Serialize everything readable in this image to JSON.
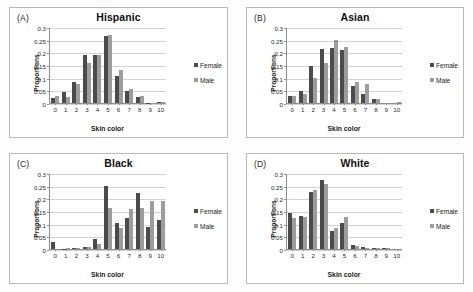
{
  "figure": {
    "y_ticks": [
      "0",
      "0.05",
      "0.1",
      "0.15",
      "0.2",
      "0.25",
      "0.3"
    ],
    "x_ticks": [
      "0",
      "1",
      "2",
      "3",
      "4",
      "5",
      "6",
      "7",
      "8",
      "9",
      "10"
    ],
    "ylabel": "Proportions",
    "xlabel": "Skin color",
    "legend": [
      {
        "label": "Female",
        "color": "#4b4b4b"
      },
      {
        "label": "Male",
        "color": "#9d9d9d"
      }
    ]
  },
  "panels": [
    {
      "tag": "(A)",
      "title": "Hispanic"
    },
    {
      "tag": "(B)",
      "title": "Asian"
    },
    {
      "tag": "(C)",
      "title": "Black"
    },
    {
      "tag": "(D)",
      "title": "White"
    }
  ],
  "chart_data": [
    {
      "type": "bar",
      "panel": "(A)",
      "title": "Hispanic",
      "xlabel": "Skin color",
      "ylabel": "Proportions",
      "ylim": [
        0,
        0.3
      ],
      "yticks": [
        0,
        0.05,
        0.1,
        0.15,
        0.2,
        0.25,
        0.3
      ],
      "grid": true,
      "legend_position": "right",
      "categories": [
        "0",
        "1",
        "2",
        "3",
        "4",
        "5",
        "6",
        "7",
        "8",
        "9",
        "10"
      ],
      "series": [
        {
          "name": "Female",
          "color": "#4b4b4b",
          "values": [
            0.021,
            0.045,
            0.085,
            0.192,
            0.191,
            0.268,
            0.108,
            0.048,
            0.026,
            0.002,
            0.003
          ]
        },
        {
          "name": "Male",
          "color": "#9d9d9d",
          "values": [
            0.027,
            0.023,
            0.077,
            0.16,
            0.193,
            0.272,
            0.134,
            0.058,
            0.027,
            0.002,
            0.005
          ]
        }
      ]
    },
    {
      "type": "bar",
      "panel": "(B)",
      "title": "Asian",
      "xlabel": "Skin color",
      "ylabel": "Proportions",
      "ylim": [
        0,
        0.3
      ],
      "yticks": [
        0,
        0.05,
        0.1,
        0.15,
        0.2,
        0.25,
        0.3
      ],
      "grid": true,
      "legend_position": "right",
      "categories": [
        "0",
        "1",
        "2",
        "3",
        "4",
        "5",
        "6",
        "7",
        "8",
        "9",
        "10"
      ],
      "series": [
        {
          "name": "Female",
          "color": "#4b4b4b",
          "values": [
            0.03,
            0.047,
            0.148,
            0.216,
            0.222,
            0.211,
            0.068,
            0.036,
            0.016,
            0.0,
            0.0
          ]
        },
        {
          "name": "Male",
          "color": "#9d9d9d",
          "values": [
            0.028,
            0.036,
            0.1,
            0.162,
            0.252,
            0.224,
            0.083,
            0.075,
            0.018,
            0.0,
            0.004
          ]
        }
      ]
    },
    {
      "type": "bar",
      "panel": "(C)",
      "title": "Black",
      "xlabel": "Skin color",
      "ylabel": "Proportions",
      "ylim": [
        0,
        0.3
      ],
      "yticks": [
        0,
        0.05,
        0.1,
        0.15,
        0.2,
        0.25,
        0.3
      ],
      "grid": true,
      "legend_position": "right",
      "categories": [
        "0",
        "1",
        "2",
        "3",
        "4",
        "5",
        "6",
        "7",
        "8",
        "9",
        "10"
      ],
      "series": [
        {
          "name": "Female",
          "color": "#4b4b4b",
          "values": [
            0.029,
            0.002,
            0.004,
            0.007,
            0.04,
            0.252,
            0.103,
            0.125,
            0.226,
            0.087,
            0.115
          ]
        },
        {
          "name": "Male",
          "color": "#9d9d9d",
          "values": [
            0.0,
            0.003,
            0.006,
            0.007,
            0.021,
            0.166,
            0.085,
            0.161,
            0.165,
            0.191,
            0.194
          ]
        }
      ]
    },
    {
      "type": "bar",
      "panel": "(D)",
      "title": "White",
      "xlabel": "Skin color",
      "ylabel": "Proportions",
      "ylim": [
        0,
        0.3
      ],
      "yticks": [
        0,
        0.05,
        0.1,
        0.15,
        0.2,
        0.25,
        0.3
      ],
      "grid": true,
      "legend_position": "right",
      "categories": [
        "0",
        "1",
        "2",
        "3",
        "4",
        "5",
        "6",
        "7",
        "8",
        "9",
        "10"
      ],
      "series": [
        {
          "name": "Female",
          "color": "#4b4b4b",
          "values": [
            0.144,
            0.132,
            0.229,
            0.278,
            0.072,
            0.105,
            0.015,
            0.007,
            0.004,
            0.004,
            0.0
          ]
        },
        {
          "name": "Male",
          "color": "#9d9d9d",
          "values": [
            0.123,
            0.127,
            0.235,
            0.259,
            0.084,
            0.128,
            0.014,
            0.006,
            0.004,
            0.003,
            0.0
          ]
        }
      ]
    }
  ]
}
